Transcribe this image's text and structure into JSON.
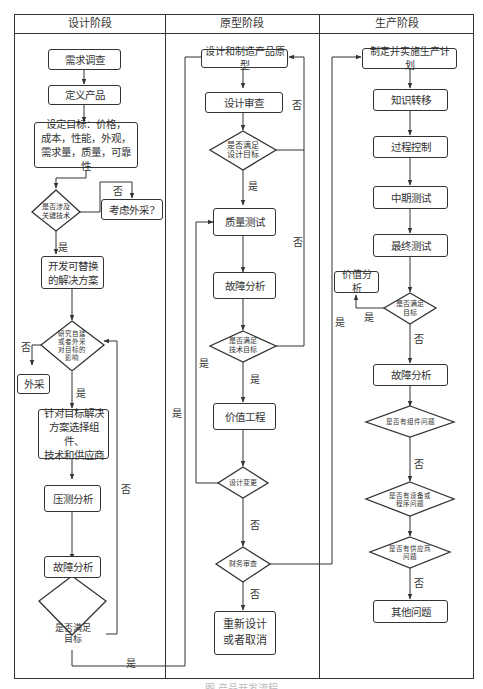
{
  "colors": {
    "line": "#333333",
    "background": "#ffffff"
  },
  "lanes": [
    {
      "id": "design",
      "label": "设计阶段"
    },
    {
      "id": "prototype",
      "label": "原型阶段"
    },
    {
      "id": "production",
      "label": "生产阶段"
    }
  ],
  "design": {
    "demand_survey": "需求调查",
    "define_product": "定义产品",
    "set_goals": [
      "设定目标：价格，",
      "成本，性能，外观，",
      "需求量，质量，可靠性"
    ],
    "key_tech_decision": [
      "是否涉及",
      "关键技术"
    ],
    "consider_outsource": "考虑外采?",
    "alt_solution": [
      "开发可替换",
      "的解决方案"
    ],
    "make_or_buy_decision": [
      "研究自建",
      "或者外采",
      "对目标的",
      "影响"
    ],
    "outsource": "外采",
    "select_components": [
      "针对目标解决",
      "方案选择组件、",
      "技术和供应商"
    ],
    "stress_analysis": "压测分析",
    "failure_analysis": "故障分析",
    "meet_goals_decision": [
      "是否满足",
      "目标"
    ]
  },
  "prototype": {
    "build_prototype": "设计和制造产品原型",
    "design_review": "设计审查",
    "meet_design_decision": [
      "是否满足",
      "设计目标"
    ],
    "quality_test": "质量测试",
    "failure_analysis": "故障分析",
    "meet_tech_decision": [
      "是否满足",
      "技术目标"
    ],
    "value_engineering": "价值工程",
    "design_change_decision": "设计变更",
    "financial_review_decision": "财务审查",
    "redesign_or_cancel": [
      "重新设计",
      "或者取消"
    ]
  },
  "production": {
    "production_plan": "制定并实施生产计划",
    "knowledge_transfer": "知识转移",
    "process_control": "过程控制",
    "midterm_test": "中期测试",
    "final_test": "最终测试",
    "value_analysis": "价值分析",
    "meet_goals_decision": [
      "是否满足",
      "目标"
    ],
    "failure_analysis": "故障分析",
    "component_issue_decision": "是否有组件问题",
    "equipment_issue_decision": [
      "是否有设备或",
      "程序问题"
    ],
    "supplier_issue_decision": [
      "是否有供应商",
      "问题"
    ],
    "other_issues": "其他问题"
  },
  "edge_labels": {
    "yes": "是",
    "no": "否"
  },
  "caption": "图 产品开发流程"
}
